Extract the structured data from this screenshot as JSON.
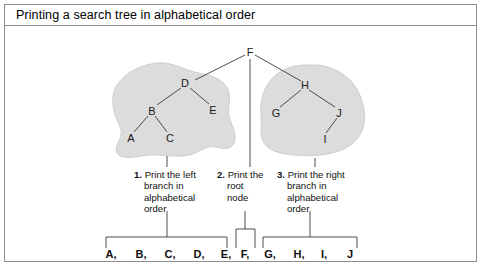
{
  "figure": {
    "title": "Printing a search tree in alphabetical order",
    "blob_color": "#dcdcdc",
    "line_color": "#3a3a3a",
    "frame_color": "#8d8d8d"
  },
  "tree": {
    "root": {
      "label": "F"
    },
    "left_subtree": {
      "nodes": [
        {
          "label": "D"
        },
        {
          "label": "B"
        },
        {
          "label": "E"
        },
        {
          "label": "A"
        },
        {
          "label": "C"
        }
      ]
    },
    "right_subtree": {
      "nodes": [
        {
          "label": "H"
        },
        {
          "label": "G"
        },
        {
          "label": "J"
        },
        {
          "label": "I"
        }
      ]
    }
  },
  "steps": [
    {
      "number": "1.",
      "text": "Print the left branch in alphabetical order"
    },
    {
      "number": "2.",
      "text": "Print the root node"
    },
    {
      "number": "3.",
      "text": "Print the right branch in alphabetical order"
    }
  ],
  "output": {
    "items": [
      {
        "text": "A,"
      },
      {
        "text": "B,"
      },
      {
        "text": "C,"
      },
      {
        "text": "D,"
      },
      {
        "text": "E,"
      },
      {
        "text": "F,"
      },
      {
        "text": "G,"
      },
      {
        "text": "H,"
      },
      {
        "text": "I,"
      },
      {
        "text": "J"
      }
    ]
  }
}
